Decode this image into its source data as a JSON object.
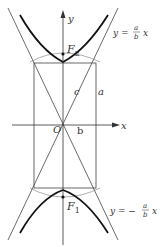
{
  "diagram": {
    "axes": {
      "x_label": "x",
      "y_label": "y",
      "origin_label": "O"
    },
    "foci": [
      {
        "label": "F",
        "sub": "2"
      },
      {
        "label": "F",
        "sub": "1"
      }
    ],
    "segment_labels": {
      "c": "c",
      "a": "a",
      "b": "b"
    },
    "asymptotes": [
      {
        "prefix": "y = ",
        "num": "a",
        "den": "b",
        "var": "x"
      },
      {
        "prefix": "y = −",
        "num": "a",
        "den": "b",
        "var": "x"
      }
    ]
  }
}
